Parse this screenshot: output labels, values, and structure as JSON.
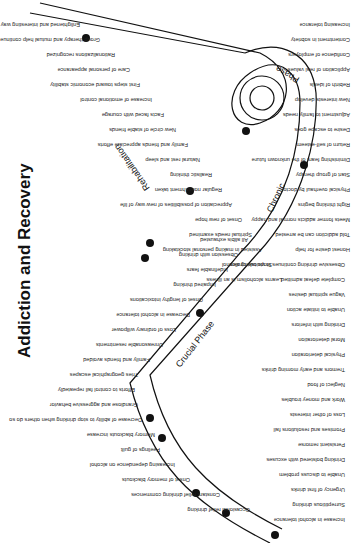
{
  "title": "Addiction and Recovery",
  "phases": {
    "crucial": "Crucial Phase",
    "chronic": "Chronic",
    "phase": "Phase",
    "rehabilitation": "Rehabilitation"
  },
  "descent_labels_above": [
    "Occasional relief drinking",
    "Constant relief drinking commences",
    "Onset of memory blackouts",
    "Increasing dependence on alcohol",
    "Feelings of guilt",
    "Memory blackouts increase",
    "Decrease of ability to stop drinking when others do so",
    "Grandiose and aggressive behavior",
    "Efforts to control fail repeatedly",
    "Tries geographical escapes",
    "Family and friends avoided",
    "Unreasonable resentments",
    "Loss of ordinary willpower",
    "Decrease in alcohol tolerance",
    "Onset of lengthy intoxications",
    "Impaired thinking",
    "Indefinable fears",
    "Obsession with drinking",
    "All alibis exhausted"
  ],
  "descent_labels_below": [
    "Increase in alcohol tolerance",
    "Surreptitious drinking",
    "Urgency of first drinks",
    "Unable to discuss problem",
    "Drinking bolstered with excuses",
    "Persistent remorse",
    "Promises and resolutions fail",
    "Loss of other interests",
    "Work and money troubles",
    "Neglect of food",
    "Tremors and early morning drinks",
    "Physical deterioration",
    "Moral deterioration",
    "Drinking with inferiors",
    "Unable to initiate action",
    "Vague spiritual desires",
    "Complete defeat admitted",
    "Obsessive drinking continues in vicious circles"
  ],
  "recovery_labels_below": [
    "Enlightened and interesting way of life opens up with road ahead to higher levels than ever before",
    "Group therapy and mutual help continue",
    "Rationalizations recognized",
    "Care of personal appearance",
    "First steps toward economic stability",
    "Increase of emotional control",
    "Facts faced with courage",
    "New circle of stable friends",
    "Family and friends appreciate efforts",
    "Natural rest and sleep",
    "Realistic thinking",
    "Regular nourishment taken",
    "Appreciation of possibilities of new way of life",
    "Onset of new hope",
    "Spiritual needs examined",
    "Assisted in making personal stocktaking",
    "Stops taking alcohol",
    "Learns alcoholism is an illness"
  ],
  "recovery_labels_above": [
    "Increasing tolerance",
    "Contentment in sobriety",
    "Confidence of employers",
    "Application of real values",
    "Rebirth of ideals",
    "New interests develop",
    "Adjustment to family needs",
    "Desire to escape goes",
    "Return of self-esteem",
    "Diminishing fears of the unknown future",
    "Start of group therapy",
    "Physical overhaul by doctor",
    "Right thinking begins",
    "Meets former addicts normal and happy",
    "Told addiction can be arrested",
    "Honest desire for help"
  ]
}
